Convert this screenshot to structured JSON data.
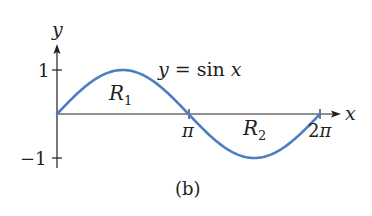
{
  "figure": {
    "caption": "(b)",
    "curve_label": "y = sin x",
    "curve_label_parts": {
      "lhs": "y",
      "eq": " = sin ",
      "var": "x"
    },
    "regions": [
      {
        "name": "R",
        "sub": "1"
      },
      {
        "name": "R",
        "sub": "2"
      }
    ],
    "axes": {
      "x_label": "x",
      "y_label": "y",
      "x_ticks": [
        "π",
        "2π"
      ],
      "y_ticks": [
        "1",
        "−1"
      ]
    },
    "colors": {
      "curve": "#4a7fc1",
      "axis": "#231f20",
      "text": "#231f20"
    }
  }
}
